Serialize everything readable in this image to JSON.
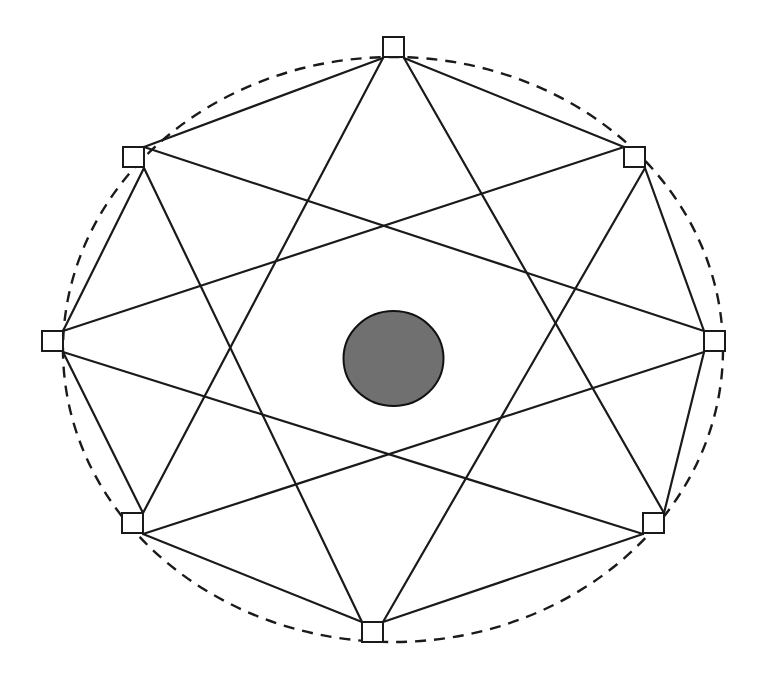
{
  "diagram": {
    "type": "network-graph",
    "canvas": {
      "width": 761,
      "height": 679
    },
    "colors": {
      "line": "#1a1a1a",
      "node_fill": "#ffffff",
      "center_fill": "#707070",
      "background": "#ffffff"
    },
    "boundary": {
      "style": "dashed",
      "cx": 393,
      "cy": 349.5,
      "rx": 330,
      "ry": 292.5
    },
    "center": {
      "shape": "circle",
      "cx": 393.5,
      "cy": 358.5,
      "rx": 50,
      "ry": 47.5
    },
    "node_size": 21,
    "nodes": [
      {
        "id": "N0",
        "position": "top",
        "x": 383,
        "y": 37
      },
      {
        "id": "N1",
        "position": "upper-right",
        "x": 624,
        "y": 147
      },
      {
        "id": "N2",
        "position": "right",
        "x": 704,
        "y": 331
      },
      {
        "id": "N3",
        "position": "lower-right",
        "x": 643,
        "y": 513
      },
      {
        "id": "N4",
        "position": "bottom",
        "x": 362,
        "y": 622
      },
      {
        "id": "N5",
        "position": "lower-left",
        "x": 122,
        "y": 513
      },
      {
        "id": "N6",
        "position": "left",
        "x": 42,
        "y": 331
      },
      {
        "id": "N7",
        "position": "upper-left",
        "x": 123,
        "y": 147
      }
    ],
    "edges": [
      {
        "from": "N0",
        "to": "N1",
        "x1": 404,
        "y1": 58,
        "x2": 624,
        "y2": 147
      },
      {
        "from": "N0",
        "to": "N7",
        "x1": 383,
        "y1": 58,
        "x2": 144,
        "y2": 147
      },
      {
        "from": "N0",
        "to": "N3",
        "x1": 404,
        "y1": 58,
        "x2": 664,
        "y2": 513
      },
      {
        "from": "N0",
        "to": "N5",
        "x1": 383,
        "y1": 58,
        "x2": 143,
        "y2": 513
      },
      {
        "from": "N1",
        "to": "N2",
        "x1": 645,
        "y1": 168,
        "x2": 704,
        "y2": 331
      },
      {
        "from": "N1",
        "to": "N6",
        "x1": 624,
        "y1": 147,
        "x2": 63,
        "y2": 331
      },
      {
        "from": "N1",
        "to": "N4",
        "x1": 645,
        "y1": 168,
        "x2": 383,
        "y2": 622
      },
      {
        "from": "N2",
        "to": "N3",
        "x1": 704,
        "y1": 352,
        "x2": 664,
        "y2": 513
      },
      {
        "from": "N2",
        "to": "N7",
        "x1": 704,
        "y1": 331,
        "x2": 144,
        "y2": 147
      },
      {
        "from": "N2",
        "to": "N5",
        "x1": 704,
        "y1": 352,
        "x2": 143,
        "y2": 534
      },
      {
        "from": "N3",
        "to": "N4",
        "x1": 643,
        "y1": 534,
        "x2": 383,
        "y2": 622
      },
      {
        "from": "N3",
        "to": "N6",
        "x1": 643,
        "y1": 534,
        "x2": 63,
        "y2": 352
      },
      {
        "from": "N4",
        "to": "N5",
        "x1": 362,
        "y1": 622,
        "x2": 143,
        "y2": 534
      },
      {
        "from": "N4",
        "to": "N7",
        "x1": 362,
        "y1": 622,
        "x2": 144,
        "y2": 168
      },
      {
        "from": "N5",
        "to": "N6",
        "x1": 143,
        "y1": 513,
        "x2": 63,
        "y2": 352
      },
      {
        "from": "N6",
        "to": "N7",
        "x1": 63,
        "y1": 331,
        "x2": 144,
        "y2": 168
      }
    ]
  }
}
